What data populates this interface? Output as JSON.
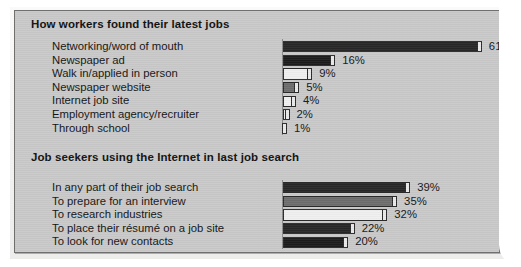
{
  "chart_data": [
    {
      "type": "bar",
      "orientation": "horizontal",
      "title": "How workers found their latest jobs",
      "xlabel": "",
      "ylabel": "",
      "xlim": [
        0,
        65
      ],
      "grid": false,
      "legend": "none",
      "value_suffix": "%",
      "categories": [
        "Networking/word of mouth",
        "Newspaper ad",
        "Walk in/applied in person",
        "Newspaper website",
        "Internet job site",
        "Employment agency/recruiter",
        "Through school"
      ],
      "values": [
        61,
        16,
        9,
        5,
        4,
        2,
        1
      ],
      "value_labels": [
        "61%",
        "16%",
        "9%",
        "5%",
        "4%",
        "2%",
        "1%"
      ],
      "bar_fills": [
        "dark",
        "darker",
        "light",
        "mid",
        "light",
        "light",
        "dark"
      ]
    },
    {
      "type": "bar",
      "orientation": "horizontal",
      "title": "Job seekers using the Internet in last job search",
      "xlabel": "",
      "ylabel": "",
      "xlim": [
        0,
        65
      ],
      "grid": false,
      "legend": "none",
      "value_suffix": "%",
      "categories": [
        "In any part of their job search",
        "To prepare for an interview",
        "To research industries",
        "To place their résumé on a job site",
        "To look for new contacts"
      ],
      "values": [
        39,
        35,
        32,
        22,
        20
      ],
      "value_labels": [
        "39%",
        "35%",
        "32%",
        "22%",
        "20%"
      ],
      "bar_fills": [
        "dark",
        "mid",
        "light",
        "dark",
        "darker"
      ]
    }
  ],
  "colors": {
    "panel_background": "#c9c9c9",
    "panel_border": "#6f6f6f",
    "page_background": "#f4f3f1",
    "text": "#141414",
    "bar_dark": "#272727",
    "bar_darker": "#1c1c1c",
    "bar_mid": "#6d6d6d",
    "bar_light": "#efefef",
    "bar_outline": "#2a2a2a",
    "bar_cap": "#e9e9e9",
    "axis_line": "#8c8c8c"
  }
}
